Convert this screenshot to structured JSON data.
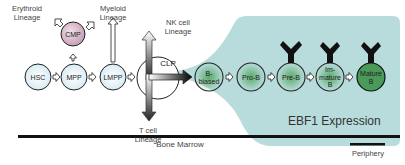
{
  "colors": {
    "ebf1_region": "#b8dcdc",
    "stem_fill": "#e4f2f8",
    "cmp_fill": "#d8b8c8",
    "b_gradient": "#5aaa6a",
    "mature_fill": "#4a9a5a",
    "outline": "#222222"
  },
  "lineages": {
    "erythroid": "Erythroid\nLineage",
    "myeloid": "Myeloid\nLineage",
    "nk": "NK cell\nLineage",
    "t": "T cell\nLineage"
  },
  "cells": {
    "hsc": "HSC",
    "mpp": "MPP",
    "lmpp": "LMPP",
    "cmp": "CMP",
    "clp": "CLP",
    "b_biased": "B-\nbiased",
    "pro_b": "Pro-B",
    "pre_b": "Pre-B",
    "immature_b": "Im-\nmature\nB",
    "mature_b": "Mature\nB"
  },
  "regions": {
    "ebf1": "EBF1 Expression",
    "bone_marrow": "Bone Marrow",
    "periphery": "Periphery"
  }
}
